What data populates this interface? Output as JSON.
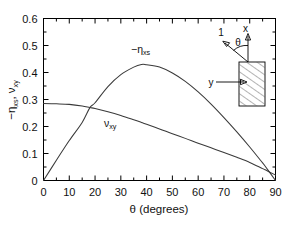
{
  "figure": {
    "background_color": "#ffffff",
    "frame_color": "#000000",
    "curve_color": "#3a3a3a"
  },
  "axes": {
    "x_title": "θ (degrees)",
    "y_title_part1": "−η",
    "y_title_sub1": "xs",
    "y_title_sep": ", ",
    "y_title_part2": "ν",
    "y_title_sub2": "xy",
    "x_ticks": [
      "0",
      "10",
      "20",
      "30",
      "40",
      "50",
      "60",
      "70",
      "80",
      "90"
    ],
    "y_ticks": [
      "0",
      "0.1",
      "0.2",
      "0.3",
      "0.4",
      "0.5",
      "0.6"
    ]
  },
  "curve_labels": {
    "eta_main": "−η",
    "eta_sub": "xs",
    "nu_main": "ν",
    "nu_sub": "xy"
  },
  "inset": {
    "axis_1_label": "1",
    "axis_x_label": "x",
    "axis_y_label": "y",
    "angle_label": "θ"
  },
  "chart_data": {
    "type": "line",
    "title": "",
    "xlabel": "θ (degrees)",
    "ylabel": "−ηxs, νxy",
    "xlim": [
      0,
      90
    ],
    "ylim": [
      0,
      0.6
    ],
    "xticks": [
      0,
      10,
      20,
      30,
      40,
      50,
      60,
      70,
      80,
      90
    ],
    "yticks": [
      0,
      0.1,
      0.2,
      0.3,
      0.4,
      0.5,
      0.6
    ],
    "x_minor_tick_step": 5,
    "y_minor_tick_step": 0.05,
    "grid": false,
    "legend": "inline-annotations",
    "annotations": [
      {
        "text": "−ηxs",
        "x": 38,
        "y": 0.49
      },
      {
        "text": "νxy",
        "x": 31,
        "y": 0.215
      }
    ],
    "x": [
      0,
      5,
      10,
      15,
      18,
      20,
      25,
      30,
      35,
      38,
      40,
      45,
      50,
      55,
      60,
      65,
      70,
      75,
      80,
      85,
      86,
      90
    ],
    "series": [
      {
        "name": "−ηxs",
        "values": [
          0.0,
          0.075,
          0.148,
          0.215,
          0.27,
          0.288,
          0.348,
          0.392,
          0.42,
          0.43,
          0.429,
          0.42,
          0.398,
          0.367,
          0.328,
          0.283,
          0.233,
          0.18,
          0.124,
          0.065,
          0.053,
          0.0
        ]
      },
      {
        "name": "νxy",
        "values": [
          0.285,
          0.284,
          0.282,
          0.276,
          0.27,
          0.267,
          0.255,
          0.241,
          0.225,
          0.215,
          0.208,
          0.191,
          0.173,
          0.156,
          0.138,
          0.121,
          0.104,
          0.086,
          0.067,
          0.044,
          0.04,
          0.02
        ]
      }
    ]
  }
}
